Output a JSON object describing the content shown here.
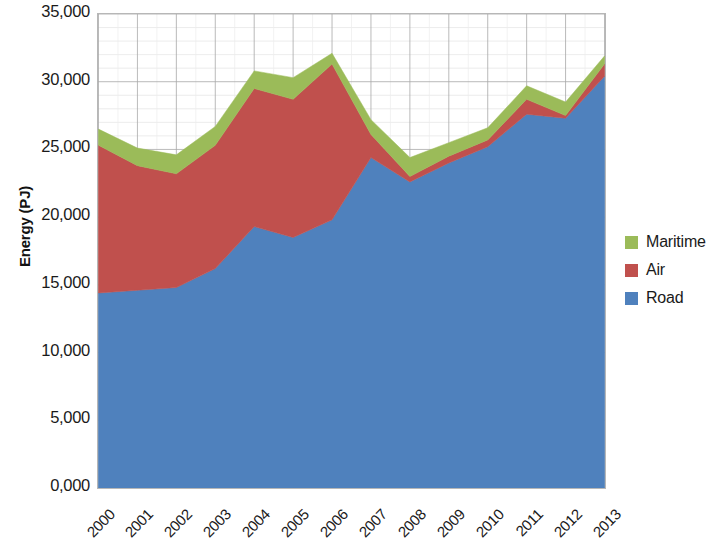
{
  "chart_data": {
    "type": "area",
    "stacked": true,
    "title": "",
    "subtitle": "",
    "xlabel": "",
    "ylabel": "Energy (PJ)",
    "categories": [
      "2000",
      "2001",
      "2002",
      "2003",
      "2004",
      "2005",
      "2006",
      "2007",
      "2008",
      "2009",
      "2010",
      "2011",
      "2012",
      "2013"
    ],
    "x_tick_labels": [
      "2000",
      "2001",
      "2002",
      "2003",
      "2004",
      "2005",
      "2006",
      "2007",
      "2008",
      "2009",
      "2010",
      "2011",
      "2012",
      "2013"
    ],
    "y_tick_labels": [
      "0,000",
      "5,000",
      "10,000",
      "15,000",
      "20,000",
      "25,000",
      "30,000",
      "35,000"
    ],
    "y_tick_values": [
      0,
      5000,
      10000,
      15000,
      20000,
      25000,
      30000,
      35000
    ],
    "ylim": [
      0,
      35000
    ],
    "grid": true,
    "grid_minor": true,
    "legend_position": "right",
    "series": [
      {
        "name": "Road",
        "color": "#4f81bd",
        "values": [
          14400,
          14600,
          14800,
          16200,
          19300,
          18500,
          19800,
          24400,
          22600,
          24000,
          25200,
          27600,
          27300,
          30400
        ]
      },
      {
        "name": "Air",
        "color": "#c0504d",
        "values": [
          10900,
          9200,
          8400,
          9100,
          10200,
          10200,
          11500,
          1700,
          400,
          500,
          500,
          1100,
          200,
          900
        ]
      },
      {
        "name": "Maritime",
        "color": "#9bbb59",
        "values": [
          1200,
          1300,
          1400,
          1400,
          1300,
          1600,
          800,
          1100,
          1400,
          1000,
          900,
          1000,
          1000,
          600
        ]
      }
    ],
    "series_order_top_to_bottom": [
      "Maritime",
      "Air",
      "Road"
    ],
    "totals": [
      26500,
      25100,
      24600,
      26700,
      30800,
      30300,
      32100,
      27200,
      24400,
      25500,
      26600,
      29700,
      28500,
      31900
    ]
  },
  "legend": {
    "items": [
      {
        "label": "Maritime",
        "color": "#9bbb59"
      },
      {
        "label": "Air",
        "color": "#c0504d"
      },
      {
        "label": "Road",
        "color": "#4f81bd"
      }
    ]
  },
  "axes": {
    "y_title": "Energy (PJ)"
  }
}
